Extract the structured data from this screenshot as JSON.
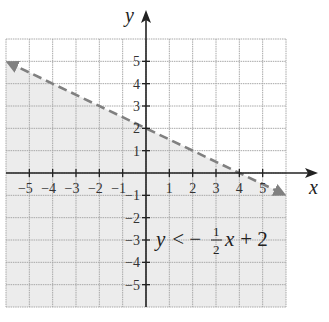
{
  "chart_data": {
    "type": "line",
    "title": "",
    "xlabel": "x",
    "ylabel": "y",
    "xlim": [
      -6,
      6
    ],
    "ylim": [
      -6,
      6
    ],
    "grid": true,
    "x_ticks": [
      -5,
      -4,
      -3,
      -2,
      -1,
      1,
      2,
      3,
      4,
      5
    ],
    "y_ticks": [
      -5,
      -4,
      -3,
      -2,
      -1,
      1,
      2,
      3,
      4,
      5
    ],
    "x_tick_labels": [
      "−5",
      "−4",
      "−3",
      "−2",
      "−1",
      "1",
      "2",
      "3",
      "4",
      "5"
    ],
    "y_tick_labels": [
      "−5",
      "−4",
      "−3",
      "−2",
      "−1",
      "1",
      "2",
      "3",
      "4",
      "5"
    ],
    "series": [
      {
        "name": "boundary line y = -1/2 x + 2",
        "style": "dashed",
        "slope": -0.5,
        "intercept": 2,
        "x": [
          -6,
          6
        ],
        "y": [
          5,
          -1
        ],
        "color": "#808080"
      }
    ],
    "shaded_region": {
      "description": "half-plane below the dashed line",
      "inequality": "y < -1/2 x + 2",
      "color": "#ececec"
    },
    "annotation": {
      "text_parts": [
        "y",
        " < −",
        "1",
        "2",
        "x",
        " + 2"
      ],
      "position": [
        1.0,
        -3.0
      ]
    }
  },
  "labels": {
    "x_axis": "x",
    "y_axis": "y",
    "inequality_lhs": "y",
    "inequality_op": " < −",
    "frac_num": "1",
    "frac_den": "2",
    "inequality_var": "x",
    "inequality_rest": " + 2"
  },
  "colors": {
    "grid": "#a8a8a8",
    "axis": "#222222",
    "shade": "#ececec",
    "boundary": "#808080"
  }
}
